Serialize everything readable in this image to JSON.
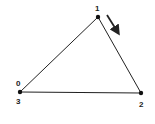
{
  "diagram": {
    "type": "triangle-path",
    "colors": {
      "stroke": "#222222",
      "background": "#ffffff"
    },
    "vertices": [
      {
        "id": "v0",
        "x": 20,
        "y": 92,
        "labels": [
          "0",
          "3"
        ]
      },
      {
        "id": "v1",
        "x": 98,
        "y": 17,
        "labels": [
          "1"
        ]
      },
      {
        "id": "v2",
        "x": 141,
        "y": 93,
        "labels": [
          "2"
        ]
      }
    ],
    "labels": {
      "v0_top": "0",
      "v0_bottom": "3",
      "v1": "1",
      "v2": "2"
    },
    "direction_arrow": {
      "from": [
        107,
        15
      ],
      "to": [
        119,
        35
      ],
      "meaning": "traversal direction 1 to 2"
    }
  }
}
